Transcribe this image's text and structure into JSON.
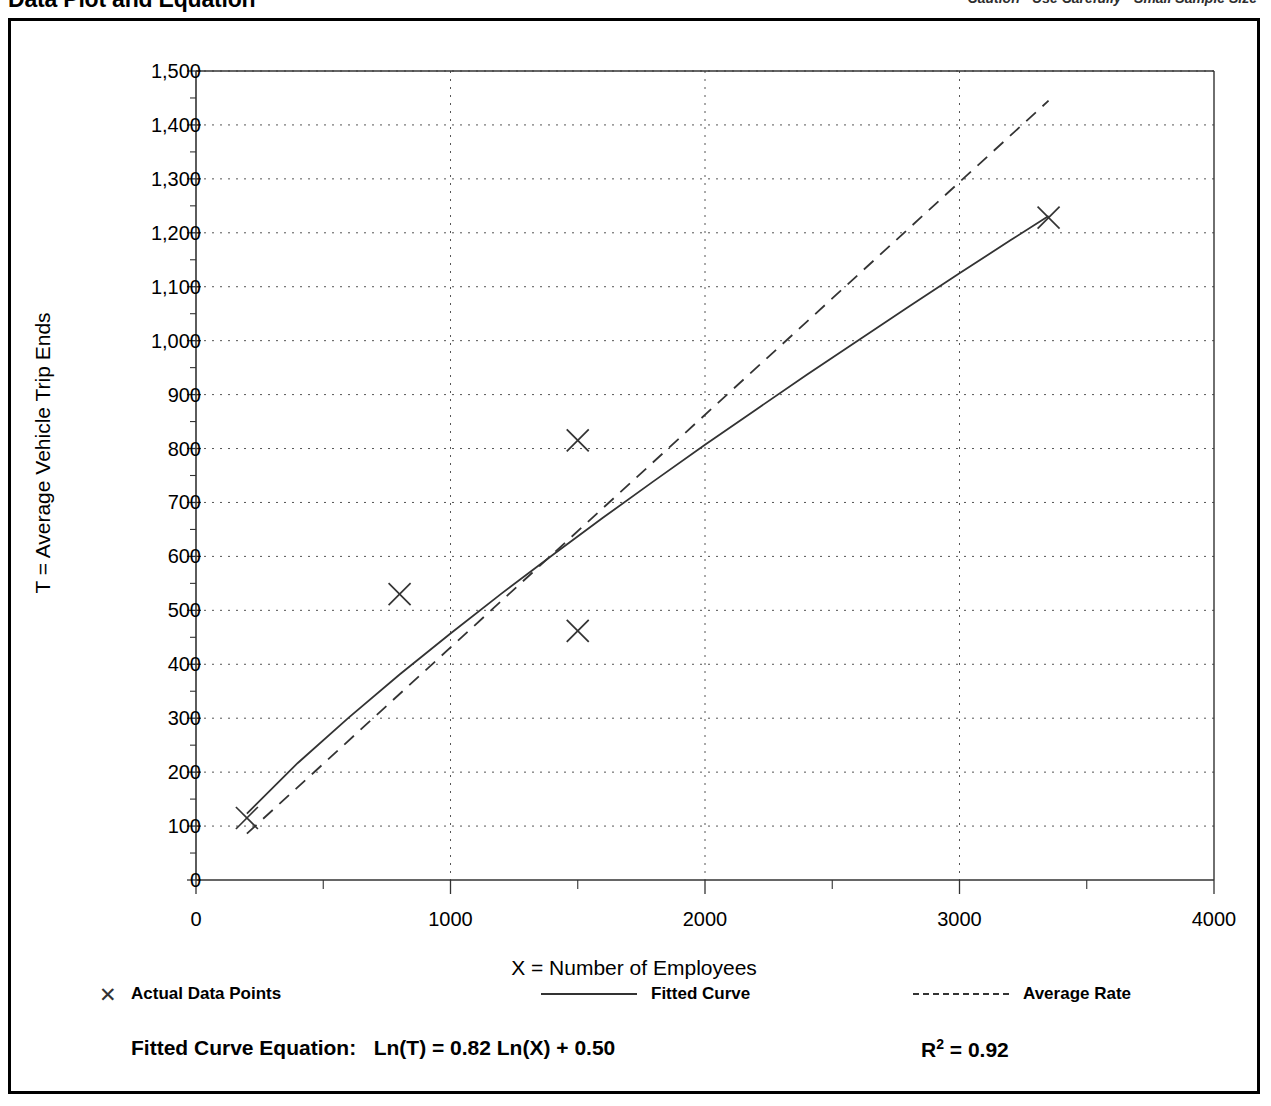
{
  "header": {
    "title": "Data Plot and Equation",
    "note": "Caution - Use Carefully - Small Sample Size"
  },
  "legend": {
    "items": [
      {
        "label": "Actual Data Points",
        "marker": "x-marker-icon"
      },
      {
        "label": "Fitted Curve",
        "marker": "solid-line-icon"
      },
      {
        "label": "Average Rate",
        "marker": "dashed-line-icon"
      }
    ]
  },
  "equation": {
    "label": "Fitted Curve Equation:",
    "formula": "Ln(T) = 0.82 Ln(X) + 0.50",
    "r_squared_label": "R",
    "r_squared_exp": "2",
    "r_squared_value": "= 0.92"
  },
  "chart_data": {
    "type": "scatter",
    "title": "Data Plot and Equation",
    "xlabel": "X = Number of Employees",
    "ylabel": "T = Average Vehicle Trip Ends",
    "xlim": [
      0,
      4000
    ],
    "ylim": [
      0,
      1500
    ],
    "xticks": [
      0,
      1000,
      2000,
      3000,
      4000
    ],
    "xtick_labels": [
      "0",
      "1000",
      "2000",
      "3000",
      "4000"
    ],
    "xminor_step": 500,
    "yticks": [
      0,
      100,
      200,
      300,
      400,
      500,
      600,
      700,
      800,
      900,
      1000,
      1100,
      1200,
      1300,
      1400,
      1500
    ],
    "ytick_labels": [
      "0",
      "100",
      "200",
      "300",
      "400",
      "500",
      "600",
      "700",
      "800",
      "900",
      "1,000",
      "1,100",
      "1,200",
      "1,300",
      "1,400",
      "1,500"
    ],
    "yminor_step": 50,
    "grid": true,
    "grid_style": "dotted",
    "legend_position": "below-plot",
    "points": [
      {
        "x": 200,
        "y": 115
      },
      {
        "x": 800,
        "y": 530
      },
      {
        "x": 1500,
        "y": 815
      },
      {
        "x": 1500,
        "y": 462
      },
      {
        "x": 3350,
        "y": 1228
      }
    ],
    "series": [
      {
        "name": "Fitted Curve",
        "style": "solid",
        "equation": "Ln(T) = 0.82 Ln(X) + 0.50",
        "coef_a": 0.82,
        "coef_b": 0.5,
        "x_range": [
          200,
          3350
        ],
        "x": [
          200,
          400,
          600,
          800,
          1000,
          1200,
          1400,
          1600,
          1800,
          2000,
          2200,
          2400,
          2600,
          2800,
          3000,
          3200,
          3350
        ],
        "y": [
          123,
          217,
          301,
          381,
          457,
          531,
          602,
          672,
          740,
          807,
          872,
          937,
          1000,
          1063,
          1125,
          1186,
          1231
        ]
      },
      {
        "name": "Average Rate",
        "style": "dashed",
        "rate": 0.4314,
        "x_range": [
          200,
          3350
        ],
        "x": [
          200,
          3350
        ],
        "y": [
          86,
          1445
        ]
      }
    ],
    "r_squared": 0.92
  }
}
